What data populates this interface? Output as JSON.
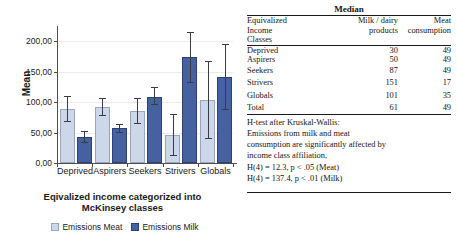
{
  "chart_data": {
    "type": "bar",
    "title": "",
    "xlabel": "Eqivalized income categorized into McKinsey classes",
    "ylabel": "Mean",
    "ylim": [
      0,
      225
    ],
    "yticks": [
      0,
      50,
      100,
      150,
      200
    ],
    "ytick_labels": [
      "0,00",
      "50,00",
      "100,00",
      "150,00",
      "200,00"
    ],
    "grid": true,
    "legend_position": "bottom",
    "categories": [
      "Deprived",
      "Aspirers",
      "Seekers",
      "Strivers",
      "Globals"
    ],
    "series": [
      {
        "name": "Emissions Meat",
        "color": "#ccd7e9",
        "values": [
          89,
          92,
          86,
          46,
          103
        ],
        "error_low": [
          68,
          77,
          64,
          12,
          39
        ],
        "error_high": [
          110,
          107,
          107,
          81,
          167
        ]
      },
      {
        "name": "Emissions Milk",
        "color": "#46619f",
        "values": [
          42,
          57,
          109,
          174,
          141
        ],
        "error_low": [
          33,
          50,
          95,
          132,
          87
        ],
        "error_high": [
          52,
          64,
          124,
          215,
          196
        ]
      }
    ]
  },
  "chart": {
    "y_axis_title": "Mean",
    "x_axis_title_line1": "Eqivalized income categorized into",
    "x_axis_title_line2": "McKinsey classes",
    "legend": [
      {
        "label": "Emissions Meat",
        "color": "#ccd7e9"
      },
      {
        "label": "Emissions Milk",
        "color": "#46619f"
      }
    ]
  },
  "table": {
    "title": "Median",
    "headers": {
      "classes_line1": "Equivalized",
      "classes_line2": "Income",
      "classes_line3": "Classes",
      "milk_line1": "Milk / dairy",
      "milk_line2": "products",
      "meat_line1": "Meat",
      "meat_line2": "consumption"
    },
    "rows": [
      {
        "cls": "Deprived",
        "milk": "30",
        "meat": "49"
      },
      {
        "cls": "Aspirers",
        "milk": "50",
        "meat": "49"
      },
      {
        "cls": "Seekers",
        "milk": "87",
        "meat": "49"
      },
      {
        "cls": "Strivers",
        "milk": "151",
        "meat": "17"
      },
      {
        "cls": "Globals",
        "milk": "101",
        "meat": "35"
      },
      {
        "cls": "Total",
        "milk": "61",
        "meat": "49"
      }
    ],
    "note": [
      "H-test after Kruskal-Wallis:",
      "Emissions from milk and  meat",
      "consumption are significantly affected by",
      "income class affiliation,",
      "H(4) = 12.3, p < .05 (Meat)",
      "H(4) = 137.4, p < .01 (Milk)"
    ]
  }
}
